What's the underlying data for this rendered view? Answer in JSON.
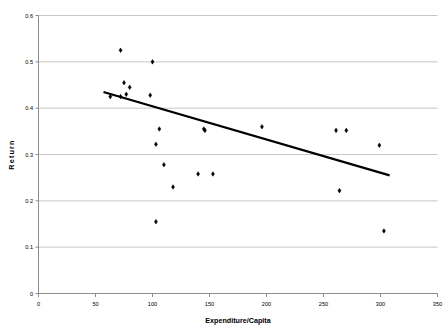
{
  "chart": {
    "title": "",
    "xlabel": "Expenditure/Capita",
    "ylabel": "Return"
  },
  "chart_data": {
    "type": "scatter",
    "title": "",
    "xlabel": "Expenditure/Capita",
    "ylabel": "Return",
    "xlim": [
      0,
      350
    ],
    "ylim": [
      0,
      0.6
    ],
    "xticks": [
      0,
      50,
      100,
      150,
      200,
      250,
      300,
      350
    ],
    "xtick_labels": [
      "0",
      "50",
      "100",
      "150",
      "200",
      "250",
      "300",
      "350"
    ],
    "yticks": [
      0,
      0.1,
      0.2,
      0.3,
      0.4,
      0.5,
      0.6
    ],
    "ytick_labels": [
      "0",
      "0.1",
      "0.2",
      "0.3",
      "0.4",
      "0.5",
      "0.6"
    ],
    "grid": "horizontal",
    "grid_color": "#b0b0b0",
    "marker_color": "#000000",
    "marker_shape": "diamond",
    "legend": "none",
    "points": [
      {
        "x": 72,
        "y": 0.525
      },
      {
        "x": 63,
        "y": 0.425
      },
      {
        "x": 75,
        "y": 0.455
      },
      {
        "x": 80,
        "y": 0.445
      },
      {
        "x": 72,
        "y": 0.425
      },
      {
        "x": 77,
        "y": 0.43
      },
      {
        "x": 100,
        "y": 0.5
      },
      {
        "x": 98,
        "y": 0.428
      },
      {
        "x": 106,
        "y": 0.355
      },
      {
        "x": 103,
        "y": 0.322
      },
      {
        "x": 110,
        "y": 0.278
      },
      {
        "x": 118,
        "y": 0.23
      },
      {
        "x": 103,
        "y": 0.155
      },
      {
        "x": 140,
        "y": 0.258
      },
      {
        "x": 153,
        "y": 0.258
      },
      {
        "x": 145,
        "y": 0.355
      },
      {
        "x": 146,
        "y": 0.352
      },
      {
        "x": 196,
        "y": 0.36
      },
      {
        "x": 261,
        "y": 0.352
      },
      {
        "x": 270,
        "y": 0.352
      },
      {
        "x": 264,
        "y": 0.222
      },
      {
        "x": 299,
        "y": 0.32
      },
      {
        "x": 303,
        "y": 0.135
      }
    ],
    "trendline": {
      "type": "linear",
      "x_start": 57,
      "y_start": 0.435,
      "x_end": 308,
      "y_end": 0.255,
      "color": "#000000",
      "width": 2.2
    }
  }
}
